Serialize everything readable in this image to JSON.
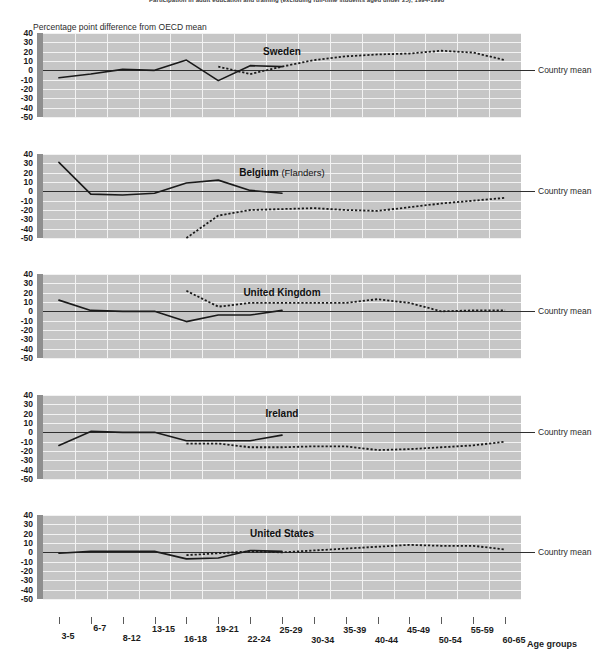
{
  "figure": {
    "title": "Participation in adult education and training (excluding full-time students aged under 25), 1994-1998",
    "axis_caption": "Percentage point difference from OECD mean",
    "xaxis_title": "Age groups",
    "mean_label": "Country mean",
    "colors": {
      "plot_background": "#c6c6c6",
      "gridline": "#f2f2f2",
      "spine": "#8e8e8e",
      "series_line": "#1a1a1a",
      "zero_line": "#2f2f2f"
    }
  },
  "chart_data": {
    "type": "line",
    "title": "Participation in adult education and training (excluding full-time students aged under 25), 1994-1998",
    "xlabel": "Age groups",
    "ylabel": "Percentage point difference from OECD mean",
    "ylim": [
      -50,
      40
    ],
    "yticks": [
      40,
      30,
      20,
      10,
      0,
      -10,
      -20,
      -30,
      -40,
      -50
    ],
    "grid": true,
    "legend_position": "right-inline",
    "categories": [
      "3-5",
      "6-7",
      "8-12",
      "13-15",
      "16-18",
      "19-21",
      "22-24",
      "25-29",
      "30-34",
      "35-39",
      "40-44",
      "45-49",
      "50-54",
      "55-59",
      "60-65"
    ],
    "panels": [
      {
        "name": "Sweden",
        "subtitle": "",
        "series": [
          {
            "name": "solid",
            "style": "solid",
            "x": [
              "3-5",
              "6-7",
              "8-12",
              "13-15",
              "16-18",
              "19-21",
              "22-24",
              "25-29"
            ],
            "values": [
              -8,
              -4,
              1,
              0,
              11,
              -11,
              5,
              4
            ]
          },
          {
            "name": "dotted",
            "style": "dotted",
            "x": [
              "19-21",
              "22-24",
              "25-29",
              "30-34",
              "35-39",
              "40-44",
              "45-49",
              "50-54",
              "55-59",
              "60-65"
            ],
            "values": [
              4,
              -4,
              4,
              11,
              15,
              17,
              18,
              21,
              19,
              11
            ]
          }
        ]
      },
      {
        "name": "Belgium",
        "subtitle": "(Flanders)",
        "series": [
          {
            "name": "solid",
            "style": "solid",
            "x": [
              "3-5",
              "6-7",
              "8-12",
              "13-15",
              "16-18",
              "19-21",
              "22-24",
              "25-29"
            ],
            "values": [
              31,
              -3,
              -4,
              -2,
              9,
              12,
              1,
              -2
            ]
          },
          {
            "name": "dotted",
            "style": "dotted",
            "x": [
              "16-18",
              "19-21",
              "22-24",
              "25-29",
              "30-34",
              "35-39",
              "40-44",
              "45-49",
              "50-54",
              "55-59",
              "60-65"
            ],
            "values": [
              -50,
              -26,
              -20,
              -19,
              -18,
              -20,
              -21,
              -17,
              -13,
              -10,
              -7
            ]
          }
        ]
      },
      {
        "name": "United Kingdom",
        "subtitle": "",
        "series": [
          {
            "name": "solid",
            "style": "solid",
            "x": [
              "3-5",
              "6-7",
              "8-12",
              "13-15",
              "16-18",
              "19-21",
              "22-24",
              "25-29"
            ],
            "values": [
              12,
              1,
              0,
              0,
              -11,
              -4,
              -4,
              1
            ]
          },
          {
            "name": "dotted",
            "style": "dotted",
            "x": [
              "16-18",
              "19-21",
              "22-24",
              "25-29",
              "30-34",
              "35-39",
              "40-44",
              "45-49",
              "50-54",
              "55-59",
              "60-65"
            ],
            "values": [
              22,
              5,
              9,
              9,
              9,
              9,
              13,
              9,
              0,
              1,
              1
            ]
          }
        ]
      },
      {
        "name": "Ireland",
        "subtitle": "",
        "series": [
          {
            "name": "solid",
            "style": "solid",
            "x": [
              "3-5",
              "6-7",
              "8-12",
              "13-15",
              "16-18",
              "19-21",
              "22-24",
              "25-29"
            ],
            "values": [
              -14,
              1,
              0,
              0,
              -9,
              -9,
              -9,
              -3
            ]
          },
          {
            "name": "dotted",
            "style": "dotted",
            "x": [
              "16-18",
              "19-21",
              "22-24",
              "25-29",
              "30-34",
              "35-39",
              "40-44",
              "45-49",
              "50-54",
              "55-59",
              "60-65"
            ],
            "values": [
              -12,
              -12,
              -16,
              -16,
              -15,
              -15,
              -19,
              -18,
              -16,
              -14,
              -10
            ]
          }
        ]
      },
      {
        "name": "United States",
        "subtitle": "",
        "series": [
          {
            "name": "solid",
            "style": "solid",
            "x": [
              "3-5",
              "6-7",
              "8-12",
              "13-15",
              "16-18",
              "19-21",
              "22-24",
              "25-29"
            ],
            "values": [
              -1,
              1,
              1,
              1,
              -7,
              -6,
              2,
              1
            ]
          },
          {
            "name": "dotted",
            "style": "dotted",
            "x": [
              "16-18",
              "19-21",
              "22-24",
              "25-29",
              "30-34",
              "35-39",
              "40-44",
              "45-49",
              "50-54",
              "55-59",
              "60-65"
            ],
            "values": [
              -3,
              -1,
              1,
              0,
              2,
              4,
              6,
              8,
              7,
              7,
              3
            ]
          }
        ]
      }
    ]
  }
}
